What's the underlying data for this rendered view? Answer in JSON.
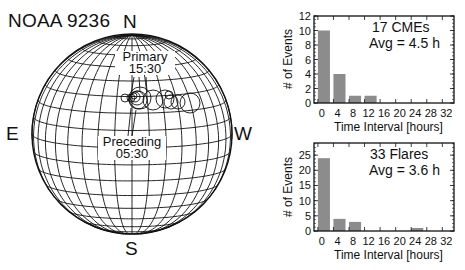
{
  "title": "NOAA 9236",
  "globe": {
    "directions": {
      "north": "N",
      "south": "S",
      "east": "E",
      "west": "W"
    },
    "annotations": [
      {
        "label": "Primary",
        "time": "15:30"
      },
      {
        "label": "Preceding",
        "time": "05:30"
      }
    ],
    "center": [
      132,
      134
    ],
    "radius": 100,
    "tilt_deg": 8,
    "stroke_color": "#111111",
    "circles": [
      {
        "x": 125,
        "y": 98,
        "r": 4
      },
      {
        "x": 131,
        "y": 98,
        "r": 4
      },
      {
        "x": 135,
        "y": 97,
        "r": 5
      },
      {
        "x": 137,
        "y": 98,
        "r": 7
      },
      {
        "x": 138,
        "y": 100,
        "r": 9
      },
      {
        "x": 140,
        "y": 98,
        "r": 11
      },
      {
        "x": 134,
        "y": 96,
        "r": 3
      },
      {
        "x": 153,
        "y": 100,
        "r": 10
      },
      {
        "x": 165,
        "y": 99,
        "r": 9
      },
      {
        "x": 169,
        "y": 95,
        "r": 4
      },
      {
        "x": 171,
        "y": 102,
        "r": 7
      },
      {
        "x": 178,
        "y": 102,
        "r": 7
      },
      {
        "x": 190,
        "y": 103,
        "r": 10
      }
    ]
  },
  "chart_data": [
    {
      "type": "bar",
      "title": "17 CMEs",
      "subtitle": "Avg = 4.5 h",
      "xlabel": "Time Interval [hours]",
      "ylabel": "# of Events",
      "categories": [
        "0-4",
        "4-8",
        "8-12",
        "12-16",
        "16-20",
        "20-24",
        "24-28",
        "28-32",
        "32-36"
      ],
      "bin_starts": [
        0,
        4,
        8,
        12,
        16,
        20,
        24,
        28,
        32
      ],
      "values": [
        10,
        4,
        1,
        1,
        0,
        0,
        0,
        0,
        0
      ],
      "xticks": [
        "0",
        "4",
        "8",
        "12",
        "16",
        "20",
        "24",
        "28",
        "32"
      ],
      "yticks": [
        "0",
        "2",
        "4",
        "6",
        "8",
        "10",
        "12"
      ],
      "ylim": [
        0,
        12
      ],
      "xlim": [
        -1,
        35
      ],
      "bar_color": "#8c8c8c",
      "grid": false
    },
    {
      "type": "bar",
      "title": "33 Flares",
      "subtitle": "Avg = 3.6 h",
      "xlabel": "Time Interval [hours]",
      "ylabel": "# of Events",
      "categories": [
        "0-4",
        "4-8",
        "8-12",
        "12-16",
        "16-20",
        "20-24",
        "24-28",
        "28-32",
        "32-36"
      ],
      "bin_starts": [
        0,
        4,
        8,
        12,
        16,
        20,
        24,
        28,
        32
      ],
      "values": [
        24,
        4,
        3,
        0,
        0,
        0,
        1,
        0,
        0
      ],
      "xticks": [
        "0",
        "4",
        "8",
        "12",
        "16",
        "20",
        "24",
        "28",
        "32"
      ],
      "yticks": [
        "0",
        "5",
        "10",
        "15",
        "20",
        "25"
      ],
      "ylim": [
        0,
        29
      ],
      "xlim": [
        -1,
        35
      ],
      "bar_color": "#8c8c8c",
      "grid": false
    }
  ]
}
